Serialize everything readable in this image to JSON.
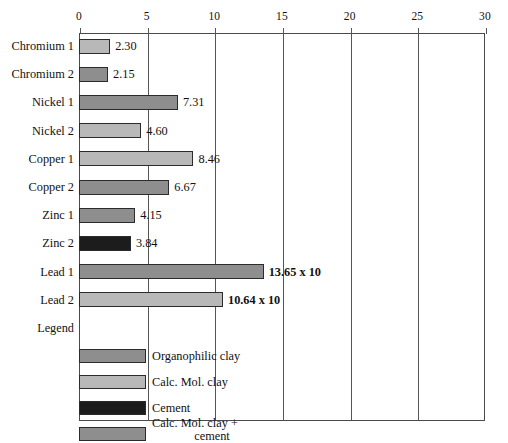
{
  "chart_data": {
    "type": "bar",
    "orientation": "horizontal",
    "title": "",
    "xlabel": "",
    "ylabel": "",
    "xlim": [
      0,
      30
    ],
    "xticks": [
      0,
      5,
      10,
      15,
      20,
      25,
      30
    ],
    "grid": true,
    "legend_position": "inside-bottom",
    "categories": [
      "Chromium 1",
      "Chromium 2",
      "Nickel 1",
      "Nickel 2",
      "Copper 1",
      "Copper 2",
      "Zinc 1",
      "Zinc 2",
      "Lead 1",
      "Lead 2"
    ],
    "values": [
      2.3,
      2.15,
      7.31,
      4.6,
      8.46,
      6.67,
      4.15,
      3.84,
      13.65,
      10.64
    ],
    "value_labels": [
      "2.30",
      "2.15",
      "7.31",
      "4.60",
      "8.46",
      "6.67",
      "4.15",
      "3.84",
      "13.65 x 10",
      "10.64 x 10"
    ],
    "bars": [
      {
        "category": "Chromium 1",
        "value": 2.3,
        "label": "2.30",
        "color": "#b8b8b8",
        "bold_label": false
      },
      {
        "category": "Chromium 2",
        "value": 2.15,
        "label": "2.15",
        "color": "#8e8e8e",
        "bold_label": false
      },
      {
        "category": "Nickel 1",
        "value": 7.31,
        "label": "7.31",
        "color": "#8e8e8e",
        "bold_label": false
      },
      {
        "category": "Nickel 2",
        "value": 4.6,
        "label": "4.60",
        "color": "#b8b8b8",
        "bold_label": false
      },
      {
        "category": "Copper 1",
        "value": 8.46,
        "label": "8.46",
        "color": "#b8b8b8",
        "bold_label": false
      },
      {
        "category": "Copper 2",
        "value": 6.67,
        "label": "6.67",
        "color": "#8e8e8e",
        "bold_label": false
      },
      {
        "category": "Zinc 1",
        "value": 4.15,
        "label": "4.15",
        "color": "#8e8e8e",
        "bold_label": false
      },
      {
        "category": "Zinc 2",
        "value": 3.84,
        "label": "3.84",
        "color": "#1c1c1c",
        "bold_label": false
      },
      {
        "category": "Lead 1",
        "value": 13.65,
        "label": "13.65 x 10",
        "color": "#8e8e8e",
        "bold_label": true
      },
      {
        "category": "Lead 2",
        "value": 10.64,
        "label": "10.64 x 10",
        "color": "#b8b8b8",
        "bold_label": true
      }
    ],
    "legend_row_label": "Legend",
    "legend": [
      {
        "label": "Organophilic clay",
        "color": "#8e8e8e"
      },
      {
        "label": "Calc. Mol. clay",
        "color": "#b8b8b8"
      },
      {
        "label": "Cement",
        "color": "#1c1c1c"
      },
      {
        "label": "Calc. Mol. clay +",
        "label2": "cement",
        "color": "#8e8e8e"
      }
    ],
    "colors": {
      "organophilic_clay": "#8e8e8e",
      "calc_mol_clay": "#b8b8b8",
      "cement": "#1c1c1c",
      "calc_mol_clay_plus_cement": "#8e8e8e",
      "axis": "#4a4a4a",
      "background": "#ffffff"
    }
  }
}
